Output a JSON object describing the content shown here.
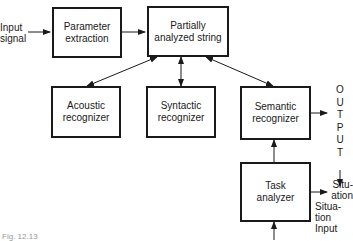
{
  "diagram": {
    "nodes": [
      {
        "id": "parameter-extraction",
        "label_line1": "Parameter",
        "label_line2": "extraction"
      },
      {
        "id": "partially-analyzed-string",
        "label_line1": "Partially",
        "label_line2": "analyzed string"
      },
      {
        "id": "acoustic-recognizer",
        "label_line1": "Acoustic",
        "label_line2": "recognizer"
      },
      {
        "id": "syntactic-recognizer",
        "label_line1": "Syntactic",
        "label_line2": "recognizer"
      },
      {
        "id": "semantic-recognizer",
        "label_line1": "Semantic",
        "label_line2": "recognizer"
      },
      {
        "id": "task-analyzer",
        "label_line1": "Task",
        "label_line2": "analyzer"
      }
    ],
    "labels": {
      "input_line1": "Input",
      "input_line2": "signal",
      "output_letters": [
        "O",
        "U",
        "T",
        "P",
        "U",
        "T"
      ],
      "situation_out_line1": "Situ-",
      "situation_out_line2": "ation",
      "situation_in_line1": "Situa-",
      "situation_in_line2": "tion",
      "situation_in_line3": "Input"
    },
    "edges": [
      {
        "from": "input-signal",
        "to": "parameter-extraction",
        "type": "arrow"
      },
      {
        "from": "parameter-extraction",
        "to": "partially-analyzed-string",
        "type": "arrow"
      },
      {
        "from": "partially-analyzed-string",
        "to": "acoustic-recognizer",
        "type": "bidirectional"
      },
      {
        "from": "partially-analyzed-string",
        "to": "syntactic-recognizer",
        "type": "bidirectional"
      },
      {
        "from": "partially-analyzed-string",
        "to": "semantic-recognizer",
        "type": "bidirectional"
      },
      {
        "from": "semantic-recognizer",
        "to": "output",
        "type": "arrow"
      },
      {
        "from": "task-analyzer",
        "to": "semantic-recognizer",
        "type": "arrow"
      },
      {
        "from": "task-analyzer",
        "to": "situation",
        "type": "arrow"
      },
      {
        "from": "situation-input",
        "to": "task-analyzer",
        "type": "arrow"
      }
    ],
    "caption": "Fig. 12.13"
  }
}
